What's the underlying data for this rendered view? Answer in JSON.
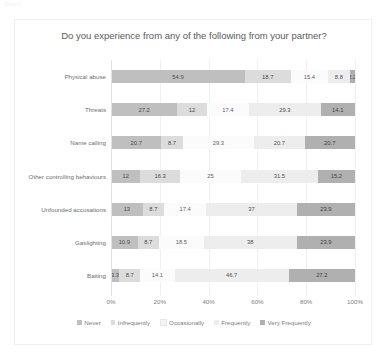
{
  "ghost_text": "Chart",
  "chart_data": {
    "type": "bar",
    "orientation": "horizontal",
    "stacked": true,
    "stack_mode": "percent",
    "title": "Do you experience from any of the following from your partner?",
    "xlabel": "",
    "ylabel": "",
    "xlim": [
      0,
      100
    ],
    "xtick_labels": [
      "0%",
      "20%",
      "40%",
      "60%",
      "80%",
      "100%"
    ],
    "xtick_values": [
      0,
      20,
      40,
      60,
      80,
      100
    ],
    "grid": true,
    "legend_position": "bottom",
    "legend": [
      "Never",
      "Infrequently",
      "Occasionally",
      "Frequently",
      "Very Frequently"
    ],
    "categories": [
      "Physical abuse",
      "Threats",
      "Name calling",
      "Other controlling behaviours",
      "Unfounded accusations",
      "Gaslighting",
      "Baiting"
    ],
    "series": [
      {
        "name": "Never",
        "color": "#bfbfbf",
        "values": [
          54.9,
          27.2,
          20.7,
          12,
          13,
          10.9,
          3.3
        ]
      },
      {
        "name": "Infrequently",
        "color": "#dcdcdc",
        "values": [
          18.7,
          12,
          8.7,
          16.3,
          8.7,
          8.7,
          8.7
        ]
      },
      {
        "name": "Occasionally",
        "color": "#fbfbfb",
        "values": [
          15.4,
          17.4,
          29.3,
          25,
          17.4,
          18.5,
          14.1
        ]
      },
      {
        "name": "Frequently",
        "color": "#ededed",
        "values": [
          8.8,
          29.3,
          20.7,
          31.5,
          37,
          38,
          46.7
        ]
      },
      {
        "name": "Very Frequently",
        "color": "#b0b0b0",
        "values": [
          2.2,
          14.1,
          20.7,
          15.2,
          23.9,
          23.9,
          27.2
        ]
      }
    ]
  }
}
